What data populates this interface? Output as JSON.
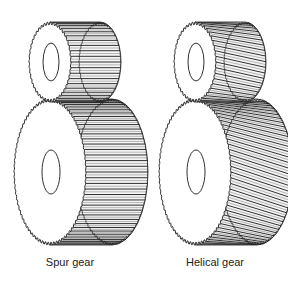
{
  "figure": {
    "type": "technical-illustration",
    "panels": [
      {
        "id": "spur",
        "caption": "Spur gear",
        "tooth_style": "straight",
        "offset_x": 0,
        "caption_x": 70
      },
      {
        "id": "helical",
        "caption": "Helical gear",
        "tooth_style": "helical",
        "offset_x": 145,
        "caption_x": 215
      }
    ],
    "colors": {
      "line": "#1a1a1a",
      "background": "#ffffff",
      "face": "#ffffff"
    }
  }
}
